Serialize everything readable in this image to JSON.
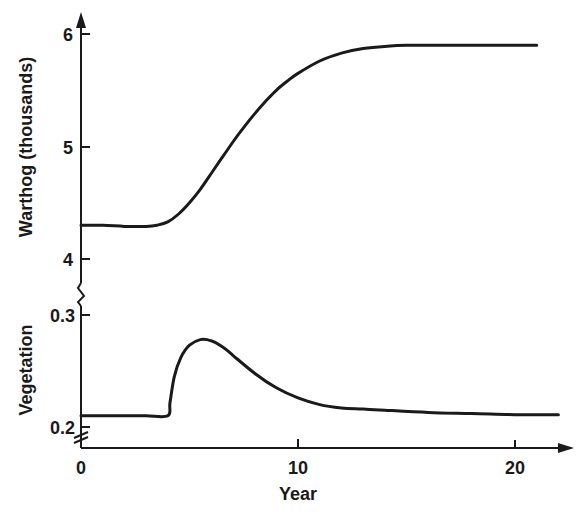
{
  "chart_data": [
    {
      "type": "line",
      "title": "",
      "xlabel": "Year",
      "ylabel": "Warthog (thousands)",
      "ylim": [
        4,
        6
      ],
      "xlim": [
        0,
        22
      ],
      "grid": false,
      "x_ticks": [
        "0",
        "10",
        "20"
      ],
      "y_ticks": [
        "4",
        "5",
        "6"
      ],
      "series": [
        {
          "name": "Warthog",
          "x": [
            0,
            1,
            2,
            3,
            3.5,
            4,
            4.5,
            5,
            5.5,
            6,
            6.5,
            7,
            7.5,
            8,
            8.5,
            9,
            9.5,
            10,
            11,
            12,
            13,
            14,
            15,
            17,
            19,
            21
          ],
          "y": [
            4.3,
            4.3,
            4.29,
            4.29,
            4.3,
            4.33,
            4.4,
            4.5,
            4.62,
            4.76,
            4.9,
            5.04,
            5.17,
            5.29,
            5.4,
            5.5,
            5.58,
            5.65,
            5.76,
            5.83,
            5.87,
            5.89,
            5.9,
            5.9,
            5.9,
            5.9
          ]
        }
      ]
    },
    {
      "type": "line",
      "title": "",
      "xlabel": "Year",
      "ylabel": "Vegetation",
      "ylim": [
        0.2,
        0.3
      ],
      "xlim": [
        0,
        22
      ],
      "grid": false,
      "x_ticks": [
        "0",
        "10",
        "20"
      ],
      "y_ticks": [
        "0.2",
        "0.3"
      ],
      "series": [
        {
          "name": "Vegetation",
          "x": [
            0,
            1,
            2,
            3,
            4,
            4.1,
            4.3,
            4.6,
            5,
            5.5,
            6,
            6.5,
            7,
            8,
            9,
            10,
            11,
            12,
            13,
            14,
            16,
            18,
            20,
            22
          ],
          "y": [
            0.21,
            0.21,
            0.21,
            0.21,
            0.21,
            0.222,
            0.245,
            0.262,
            0.273,
            0.278,
            0.277,
            0.272,
            0.264,
            0.248,
            0.235,
            0.226,
            0.22,
            0.217,
            0.216,
            0.215,
            0.213,
            0.212,
            0.211,
            0.211
          ]
        }
      ]
    }
  ],
  "axes": {
    "x_title": "Year",
    "x_tick_labels": [
      "0",
      "10",
      "20"
    ],
    "upper_y_title": "Warthog (thousands)",
    "upper_y_tick_labels": [
      "6",
      "5",
      "4"
    ],
    "lower_y_title": "Vegetation",
    "lower_y_tick_labels": [
      "0.3",
      "0.2"
    ]
  },
  "colors": {
    "ink": "#1a1a1a",
    "background": "#ffffff"
  }
}
